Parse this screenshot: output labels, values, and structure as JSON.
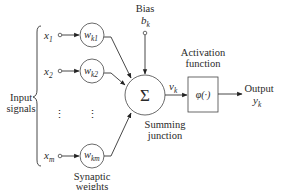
{
  "diagram": {
    "input_label": [
      "Input",
      "signals"
    ],
    "inputs": [
      {
        "symbol": "x",
        "sub": "1",
        "weight": "w",
        "weight_sub": "k1"
      },
      {
        "symbol": "x",
        "sub": "2",
        "weight": "w",
        "weight_sub": "k2"
      },
      {
        "symbol": "x",
        "sub": "m",
        "weight": "w",
        "weight_sub": "km"
      }
    ],
    "ellipsis": "⋮",
    "weights_label": [
      "Synaptic",
      "weights"
    ],
    "bias": {
      "label": "Bias",
      "symbol": "b",
      "sub": "k"
    },
    "summing": {
      "symbol": "Σ",
      "label": [
        "Summing",
        "junction"
      ]
    },
    "induced_field": {
      "symbol": "v",
      "sub": "k"
    },
    "activation": {
      "label": [
        "Activation",
        "function"
      ],
      "symbol": "φ(·)"
    },
    "output": {
      "label": "Output",
      "symbol": "y",
      "sub": "k"
    }
  }
}
